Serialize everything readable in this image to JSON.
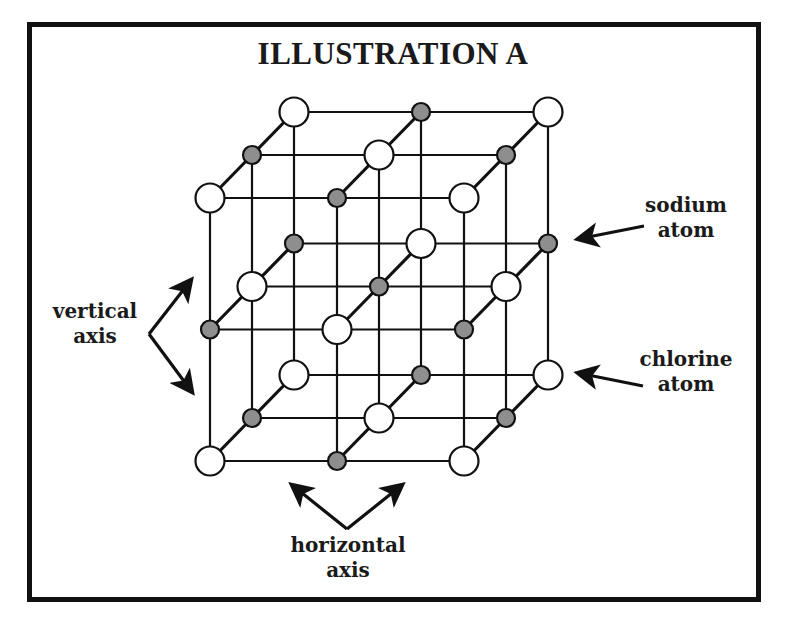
{
  "title": "ILLUSTRATION A",
  "labels": {
    "sodium": {
      "line1": "sodium",
      "line2": "atom"
    },
    "chlorine": {
      "line1": "chlorine",
      "line2": "atom"
    },
    "vertical_axis": {
      "line1": "vertical",
      "line2": "axis"
    },
    "horizontal_axis": {
      "line1": "horizontal",
      "line2": "axis"
    }
  },
  "colors": {
    "frame": "#111111",
    "line": "#111111",
    "sodium_fill": "#8e8e8e",
    "chlorine_fill": "#ffffff"
  },
  "lattice": {
    "description": "3x3x3 cubic sodium chloride crystal lattice with alternating sodium (grey, small) and chlorine (white, large) atoms",
    "size": [
      3,
      3,
      3
    ],
    "origin": [
      210,
      461
    ],
    "x_step": 127,
    "y_step": 131.5,
    "depth_step": [
      42,
      -43
    ],
    "sodium_radius": 9,
    "chlorine_radius": 14.5
  }
}
